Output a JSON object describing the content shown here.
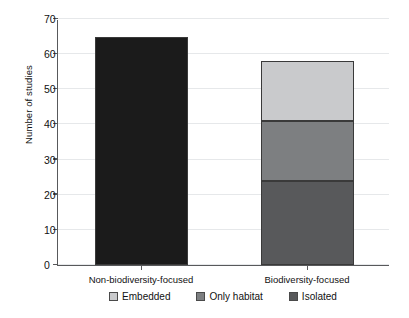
{
  "chart_data": {
    "type": "bar",
    "subtype": "stacked-bar",
    "title": "",
    "xlabel": "",
    "ylabel": "Number of studies",
    "categories": [
      "Non-biodiversity-focused",
      "Biodiversity-focused"
    ],
    "ylim": [
      0,
      70
    ],
    "yticks": [
      0,
      10,
      20,
      30,
      40,
      50,
      60,
      70
    ],
    "ytick_labels": [
      "0",
      "10",
      "20",
      "30",
      "40",
      "50",
      "60",
      "70"
    ],
    "grid": true,
    "grid_axis": "y",
    "legend_position": "bottom",
    "series": [
      {
        "name": "Embedded",
        "color": "#c9cacc",
        "values": [
          0,
          17
        ]
      },
      {
        "name": "Only habitat",
        "color": "#7d7f81",
        "values": [
          0,
          17
        ]
      },
      {
        "name": "Isolated",
        "color": "#58595b",
        "values": [
          0,
          24
        ]
      },
      {
        "name": "Non-biodiversity total",
        "color": "#1b1b1b",
        "values": [
          65,
          0
        ]
      }
    ],
    "totals": [
      65,
      58
    ],
    "stack_order_bottom_to_top": [
      "Isolated",
      "Only habitat",
      "Embedded"
    ],
    "bar_colors": {
      "non_biodiversity_focused": "#1b1b1b",
      "embedded": "#c9cacc",
      "only_habitat": "#7d7f81",
      "isolated": "#58595b"
    },
    "axis_color": "#58595b",
    "gridline_color": "#e6e8ea",
    "annotations": []
  },
  "legend": {
    "items": [
      {
        "label": "Embedded",
        "color": "#c9cacc"
      },
      {
        "label": "Only habitat",
        "color": "#7d7f81"
      },
      {
        "label": "Isolated",
        "color": "#58595b"
      }
    ]
  }
}
